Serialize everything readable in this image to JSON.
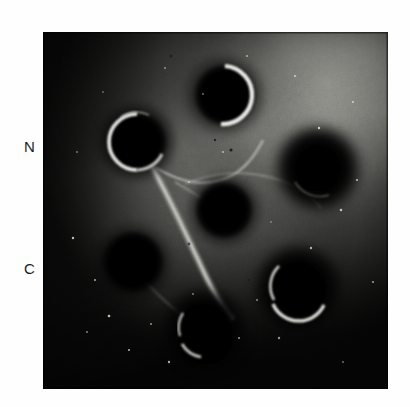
{
  "figure": {
    "kind": "immunodiffusion-gel-photograph",
    "photo": {
      "x": 43,
      "y": 32,
      "width": 345,
      "height": 357,
      "background_color": "#0b0b0b",
      "border_color": "#000000"
    },
    "labels": [
      {
        "id": "n",
        "text": "N",
        "x": 24,
        "y": 139
      },
      {
        "id": "c",
        "text": "C",
        "x": 24,
        "y": 261
      }
    ],
    "colors": {
      "well_fill": "#050505",
      "rim_highlight": "#f6f6f2",
      "gel_mid": "#6e6e6a",
      "gel_bright": "#a9a9a4",
      "gel_dark": "#151514",
      "precipitin_line": "#cfcfc8",
      "page_background": "#ffffff",
      "text": "#1c1c1c"
    },
    "wells": [
      {
        "name": "well-upper-left",
        "cx": 137,
        "cy": 142,
        "r": 28,
        "rim": "left-bottom",
        "rim_strength": "strong"
      },
      {
        "name": "well-top",
        "cx": 225,
        "cy": 95,
        "r": 29,
        "rim": "right",
        "rim_strength": "strong"
      },
      {
        "name": "well-center",
        "cx": 224,
        "cy": 210,
        "r": 27,
        "rim": "none",
        "rim_strength": "none"
      },
      {
        "name": "well-right",
        "cx": 318,
        "cy": 168,
        "r": 29,
        "rim": "bottom-left",
        "rim_strength": "faint"
      },
      {
        "name": "well-lower-left",
        "cx": 133,
        "cy": 262,
        "r": 29,
        "rim": "none",
        "rim_strength": "none"
      },
      {
        "name": "well-lower-right",
        "cx": 298,
        "cy": 288,
        "r": 28,
        "rim": "left-bottom",
        "rim_strength": "medium"
      },
      {
        "name": "well-bottom",
        "cx": 205,
        "cy": 330,
        "r": 27,
        "rim": "left-bottom",
        "rim_strength": "faint"
      }
    ],
    "precipitin_lines": [
      {
        "name": "precipitin-line-main-diagonal",
        "note": "bright band running from upper-left well down-right toward bottom well"
      },
      {
        "name": "precipitin-line-upper-fork",
        "note": "band arcing from upper-left well toward top well"
      },
      {
        "name": "precipitin-line-center-arc",
        "note": "faint halo arc around the center well"
      }
    ]
  }
}
